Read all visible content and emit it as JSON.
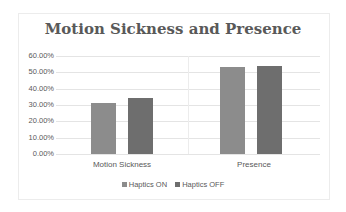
{
  "chart_data": {
    "type": "bar",
    "title": "Motion Sickness and Presence",
    "categories": [
      "Motion Sickness",
      "Presence"
    ],
    "series": [
      {
        "name": "Haptics ON",
        "values": [
          31.0,
          53.0
        ],
        "color": "#8c8c8c"
      },
      {
        "name": "Haptics OFF",
        "values": [
          34.0,
          54.0
        ],
        "color": "#6e6e6e"
      }
    ],
    "xlabel": "",
    "ylabel": "",
    "ylim": [
      0,
      60
    ],
    "yticks": [
      "0.00%",
      "10.00%",
      "20.00%",
      "30.00%",
      "40.00%",
      "50.00%",
      "60.00%"
    ],
    "grid": true,
    "legend_position": "bottom"
  }
}
